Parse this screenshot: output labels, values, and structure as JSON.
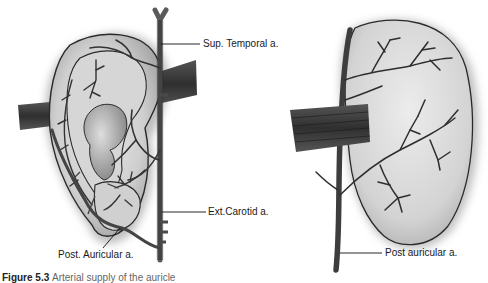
{
  "figure": {
    "left_panel": {
      "name": "Lateral surface of auricle",
      "labels": {
        "sup_temporal": "Sup. Temporal a.",
        "ext_carotid": "Ext.Carotid a.",
        "post_auricular": "Post. Auricular a."
      }
    },
    "right_panel": {
      "name": "Medial (cranial) surface of auricle",
      "labels": {
        "post_auricular": "Post auricular a."
      }
    },
    "caption": {
      "prefix": "Figure 5.3",
      "text": "Arterial supply of the auricle"
    },
    "colors": {
      "ear_fill": "#c9c9c9",
      "ear_highlight": "#e6e6e6",
      "vessel": "#4a4a4a",
      "vessel_outline": "#1e1e1e",
      "muscle": "#3a3a3a",
      "background": "#ffffff"
    }
  }
}
